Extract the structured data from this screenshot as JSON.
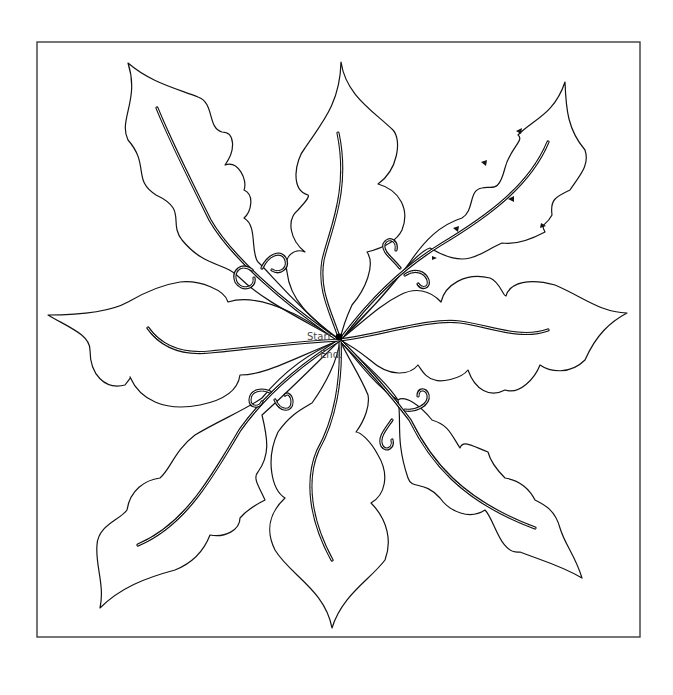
{
  "diagram": {
    "title": "",
    "type": "quilting-pattern",
    "motif": "eight-leaf holly star with center swirls",
    "labels": {
      "start": "Start.",
      "end": "End."
    },
    "leaf_count": 8,
    "colors": {
      "line": "#111111",
      "frame": "#3a3a3a",
      "background": "#ffffff",
      "label": "#444444"
    },
    "direction_arrows": "shown on upper-right leaf"
  }
}
